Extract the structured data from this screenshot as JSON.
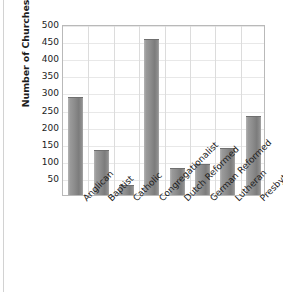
{
  "chart_data": {
    "type": "bar",
    "title": "",
    "subtitle": "",
    "xlabel": "",
    "ylabel": "Number of Churches",
    "categories": [
      "Anglican",
      "Baptist",
      "Catholic",
      "Congregationalist",
      "Dutch Reformed",
      "German Reformed",
      "Lutheran",
      "Presbyterian"
    ],
    "values": [
      288,
      132,
      30,
      455,
      80,
      90,
      138,
      232
    ],
    "ylim": [
      0,
      500
    ],
    "ytick_values": [
      50,
      100,
      150,
      200,
      250,
      300,
      350,
      400,
      450,
      500
    ],
    "ytick_labels": [
      "50",
      "100",
      "150",
      "200",
      "250",
      "300",
      "350",
      "400",
      "450",
      "500"
    ],
    "grid": {
      "horizontal": true,
      "vertical": true
    },
    "legend": null,
    "annotations": [],
    "bar_color": "#8d8d8d",
    "bar_edge_color": "#6f6f6f",
    "plot_border_color": "#b9b9b9",
    "background_color": "#ffffff",
    "text_color": "#1c1c1c"
  }
}
